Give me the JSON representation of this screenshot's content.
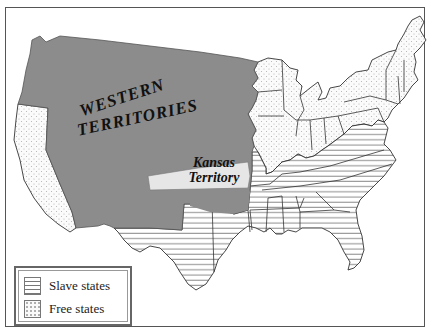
{
  "map": {
    "regions": {
      "western_territories": "WESTERN TERRITORIES",
      "western_line1": "WESTERN",
      "western_line2": "TERRITORIES",
      "kansas_line1": "Kansas",
      "kansas_line2": "Territory"
    },
    "colors": {
      "territory_fill": "#8c8c8c",
      "kansas_fill": "#e6e6e6",
      "border": "#333333",
      "hatch": "#888888",
      "dots": "#aaaaaa"
    }
  },
  "legend": {
    "items": [
      {
        "label": "Slave states",
        "pattern": "horizontal-lines"
      },
      {
        "label": "Free states",
        "pattern": "dots"
      }
    ]
  }
}
